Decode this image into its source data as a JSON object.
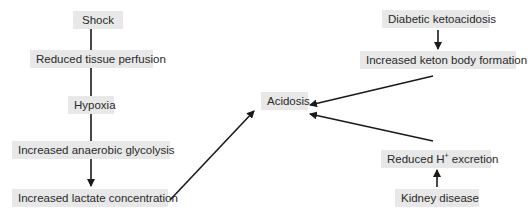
{
  "diagram": {
    "nodes": {
      "shock": {
        "label": "Shock"
      },
      "reduced_tissue_perfusion": {
        "label": "Reduced tissue perfusion"
      },
      "hypoxia": {
        "label": "Hypoxia"
      },
      "increased_anaerobic_glycolysis": {
        "label": "Increased anaerobic glycolysis"
      },
      "increased_lactate_concentration": {
        "label": "Increased lactate concentration"
      },
      "acidosis": {
        "label": "Acidosis"
      },
      "diabetic_ketoacidosis": {
        "label": "Diabetic ketoacidosis"
      },
      "increased_keton_body_formation": {
        "label": "Increased keton body formation"
      },
      "reduced_h_excretion": {
        "label_pre": "Reduced H",
        "label_sup": "+",
        "label_post": " excretion"
      },
      "kidney_disease": {
        "label": "Kidney disease"
      }
    },
    "edges": [
      {
        "from": "Shock",
        "to": "Reduced tissue perfusion",
        "type": "line"
      },
      {
        "from": "Reduced tissue perfusion",
        "to": "Hypoxia",
        "type": "line"
      },
      {
        "from": "Hypoxia",
        "to": "Increased anaerobic glycolysis",
        "type": "line"
      },
      {
        "from": "Increased anaerobic glycolysis",
        "to": "Increased lactate concentration",
        "type": "arrow"
      },
      {
        "from": "Increased lactate concentration",
        "to": "Acidosis",
        "type": "arrow"
      },
      {
        "from": "Diabetic ketoacidosis",
        "to": "Increased keton body formation",
        "type": "arrow"
      },
      {
        "from": "Increased keton body formation",
        "to": "Acidosis",
        "type": "arrow"
      },
      {
        "from": "Kidney disease",
        "to": "Reduced H+ excretion",
        "type": "arrow"
      },
      {
        "from": "Reduced H+ excretion",
        "to": "Acidosis",
        "type": "arrow"
      }
    ],
    "colors": {
      "node_fill": "#e8e8e8",
      "edge": "#1a1a1a",
      "text": "#2a2a2a"
    }
  }
}
